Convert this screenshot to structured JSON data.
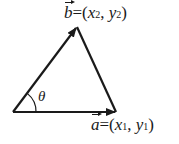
{
  "diagram": {
    "type": "vector-triangle",
    "colors": {
      "stroke": "#1a1a1a",
      "background": "#ffffff"
    },
    "vertices": {
      "origin": [
        13,
        112
      ],
      "b_tip": [
        77,
        27
      ],
      "a_tip": [
        116,
        112
      ]
    },
    "vector_b": {
      "name": "b",
      "eq": "=(",
      "x": "x",
      "x_sub": "2",
      "comma": ", ",
      "y": "y",
      "y_sub": "2",
      "close": ")"
    },
    "vector_a": {
      "name": "a",
      "eq": "=(",
      "x": "x",
      "x_sub": "1",
      "comma": ", ",
      "y": "y",
      "y_sub": "1",
      "close": ")"
    },
    "angle_label": "θ"
  }
}
